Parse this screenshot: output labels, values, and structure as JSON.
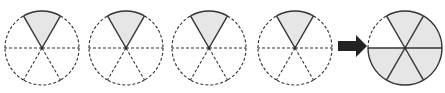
{
  "diagram": {
    "colors": {
      "shade": "#e6e6e6",
      "stroke": "#333333",
      "arrow": "#222222"
    },
    "circles": [
      {
        "cx": 42,
        "cy": 48,
        "r": 37,
        "sectors": 6,
        "shaded": [
          0
        ]
      },
      {
        "cx": 126,
        "cy": 48,
        "r": 37,
        "sectors": 6,
        "shaded": [
          0
        ]
      },
      {
        "cx": 209,
        "cy": 48,
        "r": 37,
        "sectors": 6,
        "shaded": [
          0
        ]
      },
      {
        "cx": 295,
        "cy": 48,
        "r": 37,
        "sectors": 6,
        "shaded": [
          0
        ]
      }
    ],
    "arrow": {
      "x1": 338,
      "x2": 367,
      "cy": 46
    },
    "result_circle": {
      "cx": 405,
      "cy": 48,
      "r": 37,
      "sectors": 6,
      "shaded": [
        0,
        1,
        2,
        3,
        4
      ]
    }
  }
}
